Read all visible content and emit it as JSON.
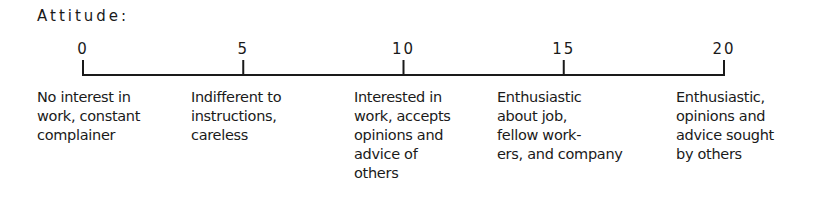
{
  "title": "Attitude:",
  "scale": {
    "min": 0,
    "max": 20,
    "ticks": [
      {
        "value": 0,
        "label": "0"
      },
      {
        "value": 5,
        "label": "5"
      },
      {
        "value": 10,
        "label": "10"
      },
      {
        "value": 15,
        "label": "15"
      },
      {
        "value": 20,
        "label": "20"
      }
    ]
  },
  "descriptions": [
    {
      "value": 0,
      "text": "No interest in\nwork, constant\ncomplainer"
    },
    {
      "value": 5,
      "text": "Indifferent to\ninstructions,\ncareless"
    },
    {
      "value": 10,
      "text": "Interested in\nwork, accepts\nopinions and\nadvice of\nothers"
    },
    {
      "value": 15,
      "text": "Enthusiastic\nabout job,\nfellow work-\ners, and company"
    },
    {
      "value": 20,
      "text": "Enthusiastic,\nopinions and\nadvice sought\nby others"
    }
  ]
}
